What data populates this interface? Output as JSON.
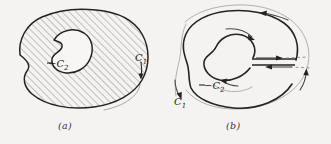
{
  "figure": {
    "background_color": "#f4f3f1",
    "ink_color": "#26231f",
    "hatch_color": "#6e6a66",
    "guide_color": "#8d8985",
    "panels": [
      {
        "id": "a",
        "caption": "(a)",
        "description": "Hatched multiply connected region bounded externally by C1 and internally by -C2",
        "hatched": true,
        "hatch_angle_degrees": 45,
        "labels": [
          {
            "name": "inner-contour-label",
            "text": "−C",
            "subscript": "2"
          },
          {
            "name": "outer-contour-label",
            "text": "C",
            "subscript": "1"
          }
        ],
        "arrows": [
          {
            "name": "outer-contour-arrow",
            "direction": "down",
            "on": "C1"
          }
        ]
      },
      {
        "id": "b",
        "caption": "(b)",
        "description": "Same region with a cross cut joining the outer contour C1 to the inner contour -C2, traversed in both directions",
        "hatched": false,
        "labels": [
          {
            "name": "inner-contour-label",
            "text": "−C",
            "subscript": "2"
          },
          {
            "name": "outer-contour-label",
            "text": "C",
            "subscript": "1"
          }
        ],
        "arrows": [
          {
            "name": "cut-arrow-outbound",
            "direction": "right",
            "on": "cut"
          },
          {
            "name": "cut-arrow-inbound",
            "direction": "left",
            "on": "cut"
          },
          {
            "name": "outer-contour-arrow-top",
            "direction": "left",
            "on": "C1"
          },
          {
            "name": "outer-contour-arrow-left",
            "direction": "down",
            "on": "C1"
          },
          {
            "name": "outer-contour-arrow-right",
            "direction": "up",
            "on": "C1"
          },
          {
            "name": "inner-contour-arrow-top",
            "direction": "right",
            "on": "-C2"
          },
          {
            "name": "inner-contour-arrow-bottom",
            "direction": "left",
            "on": "-C2"
          }
        ]
      }
    ]
  }
}
